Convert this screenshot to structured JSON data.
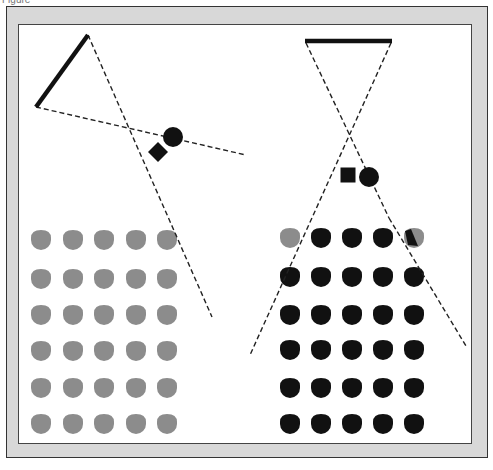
{
  "figure": {
    "caption": "Figure",
    "caption_bottom": "",
    "colors": {
      "frame": "#d8d8d8",
      "panel": "#ffffff",
      "dark": "#111111",
      "gray_dot": "#8c8c8c",
      "border": "#333333"
    },
    "left_diagram": {
      "bar": {
        "x1": 36,
        "y1": 107,
        "x2": 88,
        "y2": 35
      },
      "dashed_lines": [
        {
          "x1": 36,
          "y1": 107,
          "x2": 246,
          "y2": 155
        },
        {
          "x1": 88,
          "y1": 35,
          "x2": 212,
          "y2": 317
        }
      ],
      "circle": {
        "cx": 173,
        "cy": 137,
        "r": 10
      },
      "diamond": {
        "cx": 158,
        "cy": 152,
        "size": 16
      },
      "dots": {
        "color": "gray",
        "cols_x": [
          41,
          73,
          104,
          136,
          167
        ],
        "rows_y": [
          240,
          279,
          315,
          351,
          388,
          424
        ],
        "r": 10
      }
    },
    "right_diagram": {
      "bar": {
        "x1": 305,
        "y1": 41,
        "x2": 392,
        "y2": 41
      },
      "dashed_lines": [
        {
          "x1": 306,
          "y1": 43,
          "x2": 389,
          "y2": 218
        },
        {
          "x1": 391,
          "y1": 43,
          "x2": 250,
          "y2": 355
        },
        {
          "x1": 389,
          "y1": 218,
          "x2": 466,
          "y2": 346
        }
      ],
      "square": {
        "cx": 348,
        "cy": 175,
        "size": 15
      },
      "circle": {
        "cx": 369,
        "cy": 177,
        "r": 10
      },
      "dots": {
        "cols_x": [
          290,
          321,
          352,
          383,
          414
        ],
        "rows_y": [
          238,
          277,
          315,
          350,
          388,
          424
        ],
        "r": 10,
        "first_row_gray_cols": [
          0
        ],
        "split_dot": {
          "row": 0,
          "col": 4
        }
      }
    }
  }
}
